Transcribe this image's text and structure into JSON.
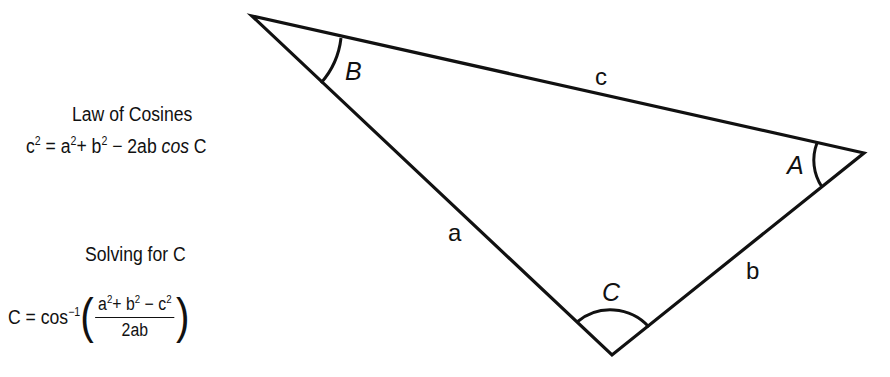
{
  "left_panel": {
    "law_heading": "Law of Cosines",
    "law_formula": {
      "lhs": "c",
      "lhs_exp": "2",
      "eq": " = a",
      "a_exp": "2",
      "plus_b": "+ b",
      "b_exp": "2",
      "rest": " − 2ab ",
      "cos": "cos",
      "tail": " C"
    },
    "solve_heading": "Solving for C",
    "solve_formula": {
      "lhs": "C = cos",
      "inv_exp": "−1",
      "open_paren": "(",
      "close_paren": ")",
      "num_a": "a",
      "num_a_exp": "2",
      "num_plus_b": "+ b",
      "num_b_exp": "2",
      "num_minus_c": " − c",
      "num_c_exp": "2",
      "denominator": "2ab"
    }
  },
  "triangle": {
    "vertices": {
      "B": [
        252,
        16
      ],
      "A": [
        864,
        153
      ],
      "C": [
        612,
        355
      ]
    },
    "stroke_color": "#111111",
    "angle_labels": {
      "A": "A",
      "B": "B",
      "C": "C"
    },
    "side_labels": {
      "a": "a",
      "b": "b",
      "c": "c"
    }
  }
}
